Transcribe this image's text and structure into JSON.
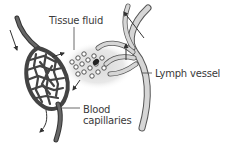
{
  "diagram": {
    "type": "biology-illustration",
    "labels": {
      "tissue_fluid": "Tissue fluid",
      "lymph_vessel": "Lymph vessel",
      "blood_capillaries_line1": "Blood",
      "blood_capillaries_line2": "capillaries"
    },
    "components": [
      {
        "name": "blood-capillary-network",
        "description": "Mesh of dark grey capillaries forming an oval bed, fed by an arteriole from upper left and drained by a venule at bottom"
      },
      {
        "name": "tissue-fluid-region",
        "description": "Light grey stippled area between capillaries and lymph vessel containing cells"
      },
      {
        "name": "lymph-vessel",
        "description": "Light grey branching vessel with blind-ended capillaries, draining upward to the right"
      }
    ],
    "arrows": [
      {
        "id": "blood-in",
        "direction": "down",
        "meaning": "Blood flow into capillary bed"
      },
      {
        "id": "fluid-out",
        "direction": "right",
        "meaning": "Fluid leaves capillaries into tissue"
      },
      {
        "id": "fluid-return",
        "direction": "down-left",
        "meaning": "Tissue fluid returns to capillaries"
      },
      {
        "id": "blood-out",
        "direction": "down-left",
        "meaning": "Blood flow out of capillary bed"
      },
      {
        "id": "lymph-in",
        "direction": "up",
        "meaning": "Fluid enters lymph vessel"
      },
      {
        "id": "lymph-out",
        "direction": "up-left",
        "meaning": "Lymph flow away"
      }
    ],
    "colors": {
      "capillary": "#4a4a4a",
      "lymph_vessel_fill": "#d6d6d6",
      "lymph_vessel_stroke": "#555555",
      "tissue_fluid": "#e4e4e4",
      "label_text": "#3a3a3a",
      "arrow": "#333333"
    }
  }
}
